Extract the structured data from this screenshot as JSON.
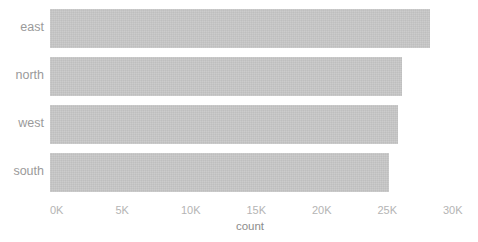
{
  "chart_data": {
    "type": "bar",
    "orientation": "horizontal",
    "title": "",
    "subtitle": "",
    "xlabel": "count",
    "ylabel": "",
    "categories": [
      "east",
      "north",
      "west",
      "south"
    ],
    "values": [
      29000,
      26900,
      26600,
      25900
    ],
    "series": [
      {
        "name": "count",
        "values": [
          29000,
          26900,
          26600,
          25900
        ]
      }
    ],
    "xlim": [
      0,
      30000
    ],
    "ylim": null,
    "xticks": [
      0,
      5000,
      10000,
      15000,
      20000,
      25000,
      30000
    ],
    "xtick_labels": [
      "0K",
      "5K",
      "10K",
      "15K",
      "20K",
      "25K",
      "30K"
    ],
    "ytick_labels": [
      "east",
      "north",
      "west",
      "south"
    ],
    "grid": false,
    "legend": false,
    "legend_position": "none",
    "annotations": []
  },
  "style": {
    "bar_color": "#c6c6c6",
    "background": "#ffffff",
    "tick_label_color": "#b4b4b4",
    "category_label_color": "#9a9a9a",
    "axis_title_color": "#8c8c8c"
  },
  "axis": {
    "x_title": "count"
  }
}
